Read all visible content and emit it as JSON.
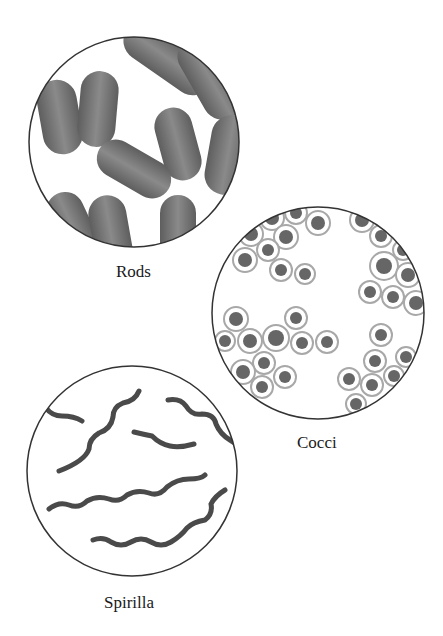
{
  "diagram": {
    "panels": [
      {
        "id": "rods",
        "label": "Rods",
        "shape": "rod-shaped bacteria"
      },
      {
        "id": "cocci",
        "label": "Cocci",
        "shape": "spherical bacteria"
      },
      {
        "id": "spirilla",
        "label": "Spirilla",
        "shape": "spiral bacteria"
      }
    ],
    "colors": {
      "outline": "#333333",
      "cell_fill": "#7a7a7a",
      "cell_dark": "#555555",
      "capsule_ring": "#bdbdbd",
      "background": "#ffffff"
    }
  }
}
